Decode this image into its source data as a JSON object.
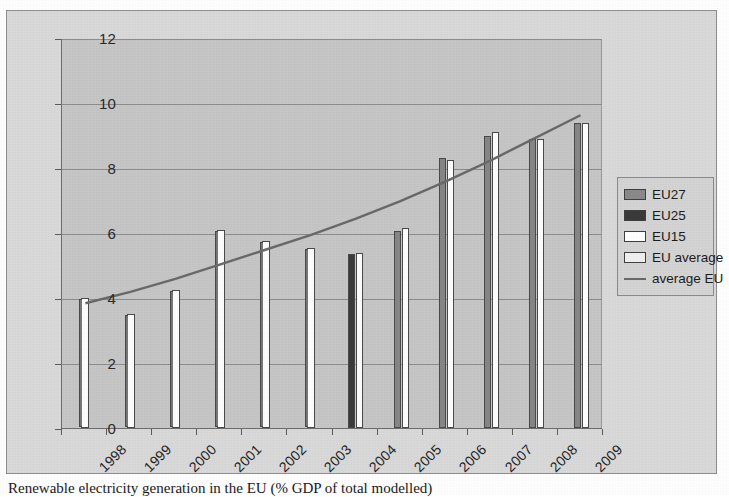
{
  "caption": "Renewable electricity generation in the EU (% GDP of total modelled)",
  "legend": {
    "position": "right",
    "items": [
      {
        "label": "EU27",
        "swatch": "eu27",
        "color": "#8a8a8a"
      },
      {
        "label": "EU25",
        "swatch": "eu25",
        "color": "#3a3a3a"
      },
      {
        "label": "EU15",
        "swatch": "eu15",
        "color": "#ffffff"
      },
      {
        "label": "EU average",
        "swatch": "euavg",
        "color": "#efefef"
      },
      {
        "label": "average EU",
        "swatch": "line",
        "color": "#6a6a6a"
      }
    ]
  },
  "chart_data": {
    "type": "bar",
    "title": "",
    "xlabel": "",
    "ylabel": "",
    "ylim": [
      0,
      12
    ],
    "yticks": [
      0,
      2,
      4,
      6,
      8,
      10,
      12
    ],
    "grid": true,
    "categories": [
      "1998",
      "1999",
      "2000",
      "2001",
      "2002",
      "2003",
      "2004",
      "2005",
      "2006",
      "2007",
      "2008",
      "2009"
    ],
    "series": [
      {
        "name": "EU27",
        "values": [
          null,
          null,
          null,
          null,
          null,
          null,
          null,
          6.05,
          8.3,
          9.0,
          8.9,
          9.4
        ]
      },
      {
        "name": "EU25",
        "values": [
          null,
          null,
          null,
          null,
          null,
          null,
          5.35,
          null,
          null,
          null,
          null,
          null
        ]
      },
      {
        "name": "EU15",
        "values": [
          null,
          null,
          null,
          null,
          null,
          null,
          5.4,
          6.15,
          8.25,
          9.1,
          8.9,
          9.4
        ]
      },
      {
        "name": "EU average",
        "values": [
          4.0,
          3.5,
          4.25,
          6.1,
          5.75,
          5.55,
          null,
          null,
          null,
          null,
          null,
          null
        ]
      }
    ],
    "trendline": {
      "name": "average EU",
      "color": "#6a6a6a",
      "values": [
        3.85,
        4.2,
        4.6,
        5.05,
        5.5,
        5.95,
        6.45,
        7.0,
        7.6,
        8.25,
        8.95,
        9.65
      ]
    }
  }
}
